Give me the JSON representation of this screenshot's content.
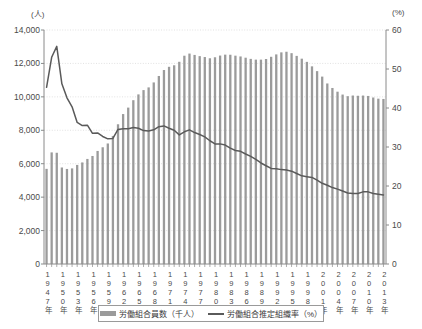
{
  "axes": {
    "left_unit": "(人)",
    "right_unit": "(%)",
    "left_ticks": [
      "14,000",
      "12,000",
      "10,000",
      "8,000",
      "6,000",
      "4,000",
      "2,000",
      "0"
    ],
    "right_ticks": [
      "60",
      "50",
      "40",
      "30",
      "20",
      "10",
      "0"
    ]
  },
  "legend": {
    "bar_label": "労働組合員数（千人）",
    "line_label": "労働組合推定組織率（%）",
    "bar_color": "#9b9b9b",
    "line_color": "#5a5a5a"
  },
  "chart_data": {
    "type": "bar",
    "title": "",
    "xlabel": "",
    "ylabel": "(人)",
    "y2label": "(%)",
    "ylim": [
      0,
      14000
    ],
    "y2lim": [
      0,
      60
    ],
    "grid": true,
    "legend_position": "bottom",
    "categories": [
      "1947年",
      "1948年",
      "1949年",
      "1950年",
      "1951年",
      "1952年",
      "1953年",
      "1954年",
      "1955年",
      "1956年",
      "1957年",
      "1958年",
      "1959年",
      "1960年",
      "1961年",
      "1962年",
      "1963年",
      "1964年",
      "1965年",
      "1966年",
      "1967年",
      "1968年",
      "1969年",
      "1970年",
      "1971年",
      "1972年",
      "1973年",
      "1974年",
      "1975年",
      "1976年",
      "1977年",
      "1978年",
      "1979年",
      "1980年",
      "1981年",
      "1982年",
      "1983年",
      "1984年",
      "1985年",
      "1986年",
      "1987年",
      "1988年",
      "1989年",
      "1990年",
      "1991年",
      "1992年",
      "1993年",
      "1994年",
      "1995年",
      "1996年",
      "1997年",
      "1998年",
      "1999年",
      "2000年",
      "2001年",
      "2002年",
      "2003年",
      "2004年",
      "2005年",
      "2006年",
      "2007年",
      "2008年",
      "2009年",
      "2010年",
      "2011年",
      "2012年",
      "2013年"
    ],
    "tick_label_indices": [
      0,
      3,
      6,
      9,
      12,
      15,
      18,
      21,
      24,
      27,
      30,
      33,
      36,
      39,
      42,
      45,
      48,
      51,
      54,
      57,
      60,
      63,
      66
    ],
    "series": [
      {
        "name": "労働組合員数（千人）",
        "type": "bar",
        "axis": "left",
        "values": [
          5692,
          6677,
          6655,
          5774,
          5687,
          5720,
          5927,
          6076,
          6286,
          6463,
          6763,
          6984,
          7211,
          7662,
          8360,
          8971,
          9357,
          9800,
          10147,
          10404,
          10566,
          10863,
          11249,
          11605,
          11798,
          11889,
          12098,
          12462,
          12590,
          12509,
          12437,
          12383,
          12309,
          12369,
          12471,
          12526,
          12520,
          12464,
          12418,
          12343,
          12272,
          12227,
          12227,
          12265,
          12397,
          12541,
          12663,
          12699,
          12614,
          12451,
          12285,
          12093,
          11825,
          11539,
          11212,
          10801,
          10531,
          10309,
          10138,
          10041,
          10080,
          10065,
          10078,
          10054,
          9961,
          9892,
          9875
        ]
      },
      {
        "name": "労働組合推定組織率（%）",
        "type": "line",
        "axis": "right",
        "values": [
          45.3,
          53.0,
          55.8,
          46.2,
          42.6,
          40.3,
          36.3,
          35.5,
          35.6,
          33.5,
          33.6,
          32.7,
          32.1,
          32.2,
          34.5,
          34.7,
          34.7,
          35.0,
          34.8,
          34.2,
          34.1,
          34.4,
          35.2,
          35.4,
          34.8,
          34.3,
          33.1,
          33.9,
          34.4,
          33.7,
          33.2,
          32.6,
          31.6,
          30.8,
          30.8,
          30.5,
          29.7,
          29.1,
          28.9,
          28.2,
          27.6,
          26.8,
          25.9,
          25.2,
          24.5,
          24.4,
          24.2,
          24.1,
          23.8,
          23.2,
          22.6,
          22.4,
          22.2,
          21.5,
          20.7,
          20.2,
          19.6,
          19.2,
          18.7,
          18.2,
          18.1,
          18.1,
          18.5,
          18.5,
          18.1,
          17.9,
          17.7
        ]
      }
    ]
  }
}
